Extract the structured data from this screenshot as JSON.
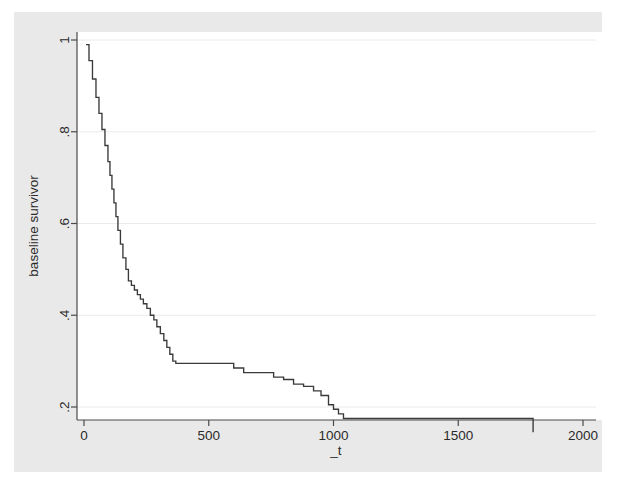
{
  "figure": {
    "background_color": "#e9e9e9",
    "plot_background_color": "#ffffff",
    "page_background_color": "#ffffff",
    "axis_color": "#4a4a4a",
    "grid_color": "#eceaea",
    "line_color": "#3a3a3a"
  },
  "chart_data": {
    "type": "line",
    "title": "",
    "subtitle": "",
    "xlabel": "_t",
    "ylabel": "baseline survivor",
    "xlim": [
      0,
      2000
    ],
    "ylim": [
      0.12,
      1.02
    ],
    "xticks": [
      0,
      500,
      1000,
      1500,
      2000
    ],
    "xticklabels": [
      "0",
      "500",
      "1000",
      "1500",
      "2000"
    ],
    "yticks": [
      0.2,
      0.4,
      0.6,
      0.8,
      1
    ],
    "yticklabels": [
      ".2",
      ".4",
      ".6",
      ".8",
      "1"
    ],
    "grid": true,
    "grid_axis": "y",
    "legend": false,
    "step_type": "post",
    "series": [
      {
        "name": "baseline survivor",
        "x": [
          8,
          20,
          34,
          48,
          60,
          72,
          84,
          96,
          104,
          112,
          120,
          128,
          136,
          146,
          156,
          168,
          178,
          190,
          202,
          214,
          226,
          238,
          252,
          266,
          280,
          292,
          306,
          320,
          332,
          344,
          356,
          368,
          560,
          600,
          640,
          700,
          760,
          800,
          840,
          880,
          920,
          950,
          980,
          1000,
          1020,
          1040,
          1380,
          1800
        ],
        "y": [
          0.99,
          0.955,
          0.915,
          0.875,
          0.84,
          0.805,
          0.77,
          0.735,
          0.705,
          0.675,
          0.645,
          0.615,
          0.585,
          0.555,
          0.525,
          0.5,
          0.475,
          0.465,
          0.455,
          0.445,
          0.435,
          0.425,
          0.415,
          0.4,
          0.39,
          0.375,
          0.36,
          0.345,
          0.33,
          0.315,
          0.3,
          0.295,
          0.295,
          0.285,
          0.275,
          0.275,
          0.265,
          0.26,
          0.25,
          0.245,
          0.235,
          0.225,
          0.205,
          0.195,
          0.185,
          0.175,
          0.175,
          0.145
        ]
      }
    ]
  }
}
